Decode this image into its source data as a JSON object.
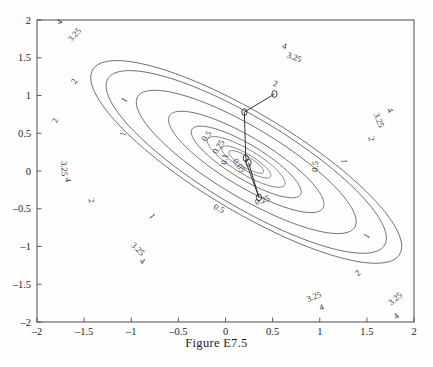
{
  "figure": {
    "caption": "Figure E7.5",
    "background_color": "#fefefe",
    "line_color": "#555555",
    "axis_color": "#4a4a4a"
  },
  "chart_data": {
    "type": "line",
    "title": "Figure E7.5",
    "subtype": "contour plot with optimization iteration path",
    "xlabel": "",
    "ylabel": "",
    "xlim": [
      -2,
      2
    ],
    "ylim": [
      -2,
      2
    ],
    "grid": false,
    "legend": null,
    "x_ticks": [
      -2,
      -1.5,
      -1,
      -0.5,
      0,
      0.5,
      1,
      1.5,
      2
    ],
    "x_tick_labels": [
      "-2",
      "-1.5",
      "-1",
      "-0.5",
      "0",
      "0.5",
      "1",
      "1.5",
      "2"
    ],
    "y_ticks": [
      -2,
      -1.5,
      -1,
      -0.5,
      0,
      0.5,
      1,
      1.5,
      2
    ],
    "y_tick_labels": [
      "-2",
      "-1.5",
      "-1",
      "-0.5",
      "0",
      "0.5",
      "1",
      "1.5",
      "2"
    ],
    "contour_levels": [
      0.05,
      0.1,
      0.25,
      0.5,
      1,
      2,
      3.25,
      4
    ],
    "contour_center": [
      0.22,
      0.12
    ],
    "contour_orientation_deg": -38,
    "contour_labels": [
      {
        "text": "4",
        "x": -1.74,
        "y": 1.95
      },
      {
        "text": "3.25",
        "x": -1.58,
        "y": 1.78
      },
      {
        "text": "4",
        "x": 0.62,
        "y": 1.62
      },
      {
        "text": "3.25",
        "x": 0.72,
        "y": 1.47
      },
      {
        "text": "2",
        "x": -1.58,
        "y": 1.17
      },
      {
        "text": "2",
        "x": 0.52,
        "y": 1.12
      },
      {
        "text": "1",
        "x": -1.05,
        "y": 0.92
      },
      {
        "text": "4",
        "x": 1.72,
        "y": 0.79
      },
      {
        "text": "3.25",
        "x": 1.6,
        "y": 0.66
      },
      {
        "text": "2",
        "x": -1.78,
        "y": 0.66
      },
      {
        "text": "1",
        "x": -1.06,
        "y": 0.48
      },
      {
        "text": "2",
        "x": 1.52,
        "y": 0.42
      },
      {
        "text": "0.5",
        "x": -0.18,
        "y": 0.44
      },
      {
        "text": "0.25",
        "x": -0.05,
        "y": 0.3
      },
      {
        "text": "0.1",
        "x": 0.02,
        "y": 0.15
      },
      {
        "text": "0.05",
        "x": 0.12,
        "y": 0.05
      },
      {
        "text": "0.5",
        "x": 0.98,
        "y": 0.06
      },
      {
        "text": "1",
        "x": 1.23,
        "y": 0.13
      },
      {
        "text": "3.25",
        "x": -1.74,
        "y": 0.03
      },
      {
        "text": "4",
        "x": -1.7,
        "y": -0.12
      },
      {
        "text": "0.25",
        "x": 0.4,
        "y": -0.42
      },
      {
        "text": "0.5",
        "x": -0.08,
        "y": -0.53
      },
      {
        "text": "1",
        "x": -0.8,
        "y": -0.62
      },
      {
        "text": "2",
        "x": -1.45,
        "y": -0.4
      },
      {
        "text": "3.25",
        "x": -0.95,
        "y": -1.06
      },
      {
        "text": "4",
        "x": -0.9,
        "y": -1.22
      },
      {
        "text": "1",
        "x": 1.52,
        "y": -0.88
      },
      {
        "text": "2",
        "x": 1.42,
        "y": -1.38
      },
      {
        "text": "3.25",
        "x": 0.95,
        "y": -1.7
      },
      {
        "text": "4",
        "x": 1.03,
        "y": -1.84
      },
      {
        "text": "3.25",
        "x": 1.82,
        "y": -1.72
      },
      {
        "text": "4",
        "x": 1.83,
        "y": -1.95
      }
    ],
    "iteration_path": {
      "marker": "circle",
      "points": [
        [
          0.52,
          1.02
        ],
        [
          0.2,
          0.78
        ],
        [
          0.215,
          0.17
        ],
        [
          0.225,
          0.155
        ],
        [
          0.21,
          0.145
        ],
        [
          0.355,
          -0.35
        ],
        [
          0.245,
          0.11
        ]
      ]
    }
  }
}
